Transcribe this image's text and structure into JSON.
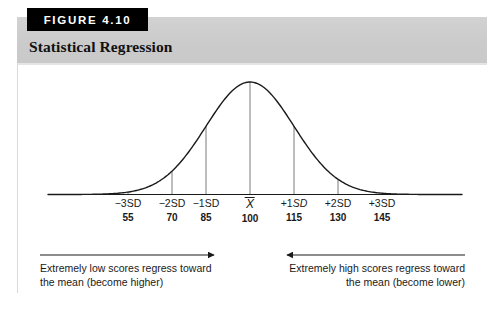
{
  "figure": {
    "tag": "FIGURE 4.10",
    "title": "Statistical Regression"
  },
  "axis": {
    "ticks": [
      {
        "sd_prefix": "−3",
        "sd_unit": "SD",
        "sd_italic": false,
        "value": "55",
        "x": 128
      },
      {
        "sd_prefix": "−2",
        "sd_unit": "SD",
        "sd_italic": false,
        "value": "70",
        "x": 172
      },
      {
        "sd_prefix": "−1",
        "sd_unit": "SD",
        "sd_italic": false,
        "value": "85",
        "x": 206
      },
      {
        "sd_prefix": "",
        "sd_unit": "X",
        "sd_italic": false,
        "value": "100",
        "x": 250,
        "is_mean": true
      },
      {
        "sd_prefix": "+1",
        "sd_unit": "SD",
        "sd_italic": true,
        "value": "115",
        "x": 294
      },
      {
        "sd_prefix": "+2",
        "sd_unit": "SD",
        "sd_italic": false,
        "value": "130",
        "x": 338
      },
      {
        "sd_prefix": "+3",
        "sd_unit": "SD",
        "sd_italic": false,
        "value": "145",
        "x": 382
      }
    ]
  },
  "captions": {
    "left_line1": "Extremely low scores regress toward",
    "left_line2": "the mean (become higher)",
    "right_line1": "Extremely high scores regress toward",
    "right_line2": "the mean (become lower)"
  },
  "colors": {
    "header_band": "#cfcfcf",
    "tag_background": "#000000",
    "tag_text": "#ffffff",
    "curve": "#1a1a1a",
    "gridline": "#6b6b6b",
    "text": "#1a1a1a"
  },
  "chart_data": {
    "type": "line",
    "title": "Statistical Regression",
    "xlabel": "",
    "ylabel": "",
    "grid": false,
    "legend": "none",
    "categories": [
      "-3SD",
      "-2SD",
      "-1SD",
      "Xbar",
      "+1SD",
      "+2SD",
      "+3SD"
    ],
    "x": [
      55,
      70,
      85,
      100,
      115,
      130,
      145
    ],
    "values": [
      0.011,
      0.135,
      0.606,
      1.0,
      0.606,
      0.135,
      0.011
    ],
    "xlim": [
      40,
      160
    ],
    "ylim": [
      0,
      1.0
    ],
    "annotations": [
      "Extremely low scores regress toward the mean (become higher)",
      "Extremely high scores regress toward the mean (become lower)"
    ]
  }
}
